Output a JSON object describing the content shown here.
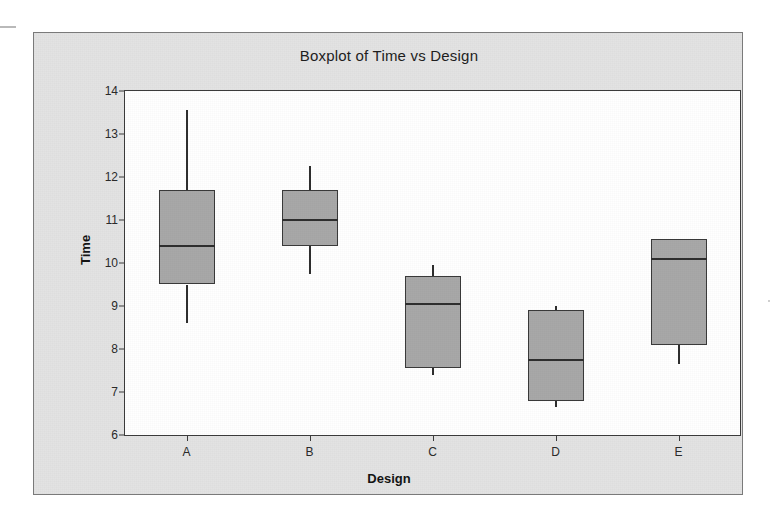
{
  "chart_data": {
    "type": "box",
    "title": "Boxplot of Time vs Design",
    "xlabel": "Design",
    "ylabel": "Time",
    "categories": [
      "A",
      "B",
      "C",
      "D",
      "E"
    ],
    "ylim": [
      6,
      14
    ],
    "yticks": [
      6,
      7,
      8,
      9,
      10,
      11,
      12,
      13,
      14
    ],
    "ytick_labels": [
      "6",
      "7",
      "8",
      "9",
      "10",
      "11",
      "12",
      "13",
      "14"
    ],
    "grid": false,
    "legend": "none",
    "box_fill_color": "#a8a8a8",
    "box_line_color": "#3a3a3a",
    "plot_background": "#ffffff",
    "figure_background": "#e3e3e3",
    "boxes": [
      {
        "category": "A",
        "min": 8.6,
        "q1": 9.5,
        "median": 10.4,
        "q3": 11.7,
        "max": 13.55
      },
      {
        "category": "B",
        "min": 9.75,
        "q1": 10.4,
        "median": 11.0,
        "q3": 11.7,
        "max": 12.25
      },
      {
        "category": "C",
        "min": 7.4,
        "q1": 7.55,
        "median": 9.05,
        "q3": 9.7,
        "max": 9.95
      },
      {
        "category": "D",
        "min": 6.65,
        "q1": 6.8,
        "median": 7.75,
        "q3": 8.9,
        "max": 9.0
      },
      {
        "category": "E",
        "min": 7.65,
        "q1": 8.1,
        "median": 10.1,
        "q3": 10.55,
        "max": 10.55
      }
    ]
  }
}
